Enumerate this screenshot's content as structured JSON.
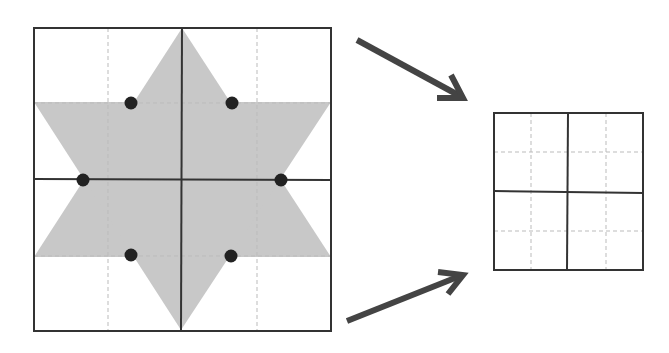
{
  "diagram": {
    "colors": {
      "star_fill": "#c8c8c8",
      "grid_line": "#333333",
      "dashed_line": "#bbbbbb",
      "dot": "#222222",
      "arrow": "#444444"
    },
    "large_grid": {
      "x": 34,
      "y": 28,
      "w": 297,
      "h": 303
    },
    "small_grid": {
      "x": 494,
      "y": 113,
      "w": 149,
      "h": 157
    },
    "dots": [
      {
        "cx": 131,
        "cy": 103
      },
      {
        "cx": 232,
        "cy": 103
      },
      {
        "cx": 83,
        "cy": 180
      },
      {
        "cx": 281,
        "cy": 180
      },
      {
        "cx": 131,
        "cy": 255
      },
      {
        "cx": 231,
        "cy": 256
      }
    ],
    "arrows": [
      {
        "name": "arrow-to-grid-top",
        "x1": 357,
        "y1": 40,
        "x2": 462,
        "y2": 97
      },
      {
        "name": "arrow-to-grid-bottom",
        "x1": 347,
        "y1": 321,
        "x2": 462,
        "y2": 275
      }
    ]
  }
}
